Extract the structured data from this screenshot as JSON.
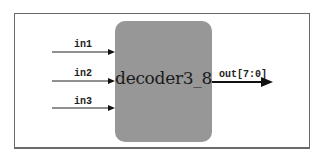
{
  "diagram": {
    "type": "rtl-block",
    "module": {
      "name": "decoder3_8",
      "fill_color": "#979797"
    },
    "inputs": [
      {
        "label": "in1"
      },
      {
        "label": "in2"
      },
      {
        "label": "in3"
      }
    ],
    "outputs": [
      {
        "label": "out[7:0]",
        "bus": true
      }
    ]
  }
}
